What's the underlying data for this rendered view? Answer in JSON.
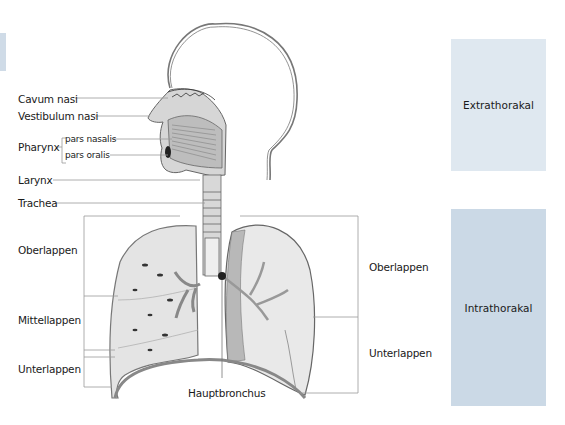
{
  "diagram": {
    "title_region": "Respiratory tract anatomy",
    "labels_left": {
      "cavum_nasi": "Cavum nasi",
      "vestibulum_nasi": "Vestibulum nasi",
      "pharynx": "Pharynx",
      "pars_nasalis": "pars nasalis",
      "pars_oralis": "pars oralis",
      "larynx": "Larynx",
      "trachea": "Trachea",
      "oberlappen": "Oberlappen",
      "mittellappen": "Mittellappen",
      "unterlappen": "Unterlappen"
    },
    "labels_right": {
      "oberlappen": "Oberlappen",
      "unterlappen": "Unterlappen"
    },
    "label_bottom": {
      "hauptbronchus": "Hauptbronchus"
    },
    "regions": {
      "extrathorakal": "Extrathorakal",
      "intrathorakal": "Intrathorakal"
    },
    "colors": {
      "extra_panel": "#dfe8f0",
      "intra_panel": "#cbd9e6",
      "line": "#8a8a8a",
      "lung_fill": "#e4e4e4"
    }
  }
}
